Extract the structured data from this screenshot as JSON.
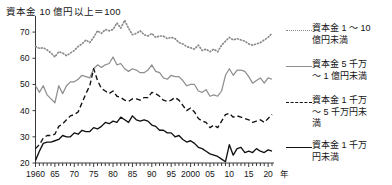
{
  "chart_data": {
    "type": "line",
    "title": "資本金 10 億円以上＝100",
    "xlabel": "年",
    "ylabel": "",
    "xlim": [
      1960,
      2021
    ],
    "ylim": [
      20,
      75
    ],
    "yticks": [
      20,
      30,
      40,
      50,
      60,
      70
    ],
    "xticks": [
      1960,
      1965,
      1970,
      1975,
      1980,
      1985,
      1990,
      1995,
      2000,
      2005,
      2010,
      2015,
      2020
    ],
    "xtick_labels": [
      "1960",
      "65",
      "70",
      "75",
      "80",
      "85",
      "90",
      "95",
      "2000",
      "05",
      "10",
      "15",
      "20"
    ],
    "grid": false,
    "legend_position": "right",
    "series": [
      {
        "name": "資本金 1 〜 10 億円未満",
        "style": "dotted",
        "color": "#8a8a8a",
        "x": [
          1960,
          1961,
          1962,
          1963,
          1964,
          1965,
          1966,
          1967,
          1968,
          1969,
          1970,
          1971,
          1972,
          1973,
          1974,
          1975,
          1976,
          1977,
          1978,
          1979,
          1980,
          1981,
          1982,
          1983,
          1984,
          1985,
          1986,
          1987,
          1988,
          1989,
          1990,
          1991,
          1992,
          1993,
          1994,
          1995,
          1996,
          1997,
          1998,
          1999,
          2000,
          2001,
          2002,
          2003,
          2004,
          2005,
          2006,
          2007,
          2008,
          2009,
          2010,
          2011,
          2012,
          2013,
          2014,
          2015,
          2016,
          2017,
          2018,
          2019,
          2020,
          2021
        ],
        "values": [
          64.5,
          63.8,
          64.0,
          63.2,
          62.0,
          60.5,
          62.5,
          62.0,
          61.0,
          62.0,
          63.0,
          64.5,
          65.5,
          67.0,
          66.0,
          68.0,
          70.5,
          69.5,
          71.0,
          70.5,
          71.0,
          73.5,
          71.5,
          74.5,
          71.5,
          69.0,
          69.5,
          70.5,
          69.0,
          68.5,
          69.5,
          68.0,
          68.5,
          68.5,
          67.5,
          68.0,
          67.5,
          66.0,
          65.5,
          64.5,
          64.0,
          63.5,
          65.0,
          63.0,
          63.5,
          62.5,
          63.5,
          62.5,
          65.0,
          66.5,
          68.0,
          67.0,
          67.5,
          67.0,
          66.5,
          65.5,
          65.0,
          65.5,
          66.0,
          67.0,
          68.0,
          69.5
        ]
      },
      {
        "name": "資本金 5 千万 〜 1 億円未満",
        "style": "solid",
        "color": "#8f8f8f",
        "x": [
          1960,
          1961,
          1962,
          1963,
          1964,
          1965,
          1966,
          1967,
          1968,
          1969,
          1970,
          1971,
          1972,
          1973,
          1974,
          1975,
          1976,
          1977,
          1978,
          1979,
          1980,
          1981,
          1982,
          1983,
          1984,
          1985,
          1986,
          1987,
          1988,
          1989,
          1990,
          1991,
          1992,
          1993,
          1994,
          1995,
          1996,
          1997,
          1998,
          1999,
          2000,
          2001,
          2002,
          2003,
          2004,
          2005,
          2006,
          2007,
          2008,
          2009,
          2010,
          2011,
          2012,
          2013,
          2014,
          2015,
          2016,
          2017,
          2018,
          2019,
          2020,
          2021
        ],
        "values": [
          49.5,
          47.0,
          49.5,
          46.0,
          44.5,
          43.0,
          49.5,
          46.5,
          49.5,
          51.0,
          51.0,
          52.0,
          53.5,
          53.0,
          52.5,
          56.0,
          57.5,
          56.5,
          57.5,
          58.0,
          60.5,
          57.5,
          58.0,
          56.0,
          55.0,
          56.0,
          55.5,
          54.5,
          54.5,
          55.5,
          57.5,
          55.0,
          54.5,
          52.5,
          52.0,
          53.5,
          53.0,
          53.0,
          51.5,
          49.5,
          50.0,
          50.0,
          47.5,
          47.0,
          48.0,
          45.5,
          46.0,
          45.5,
          47.5,
          53.5,
          56.0,
          53.5,
          55.5,
          55.5,
          55.0,
          53.0,
          50.5,
          51.5,
          52.5,
          50.5,
          52.5,
          52.0
        ]
      },
      {
        "name": "資本金 1 千万 〜 5 千万円未満",
        "style": "dashed",
        "color": "#111111",
        "x": [
          1960,
          1961,
          1962,
          1963,
          1964,
          1965,
          1966,
          1967,
          1968,
          1969,
          1970,
          1971,
          1972,
          1973,
          1974,
          1975,
          1976,
          1977,
          1978,
          1979,
          1980,
          1981,
          1982,
          1983,
          1984,
          1985,
          1986,
          1987,
          1988,
          1989,
          1990,
          1991,
          1992,
          1993,
          1994,
          1995,
          1996,
          1997,
          1998,
          1999,
          2000,
          2001,
          2002,
          2003,
          2004,
          2005,
          2006,
          2007,
          2008,
          2009,
          2010,
          2011,
          2012,
          2013,
          2014,
          2015,
          2016,
          2017,
          2018,
          2019,
          2020,
          2021
        ],
        "values": [
          25.5,
          27.0,
          29.5,
          30.5,
          30.5,
          31.0,
          34.0,
          35.0,
          36.5,
          38.0,
          38.5,
          39.5,
          43.0,
          46.5,
          49.5,
          56.0,
          51.5,
          48.5,
          47.5,
          46.5,
          47.5,
          45.5,
          45.0,
          44.0,
          43.5,
          44.5,
          44.5,
          44.0,
          45.0,
          45.0,
          47.0,
          46.5,
          45.5,
          44.0,
          43.5,
          44.0,
          45.0,
          44.0,
          42.0,
          40.0,
          41.0,
          39.5,
          37.0,
          36.0,
          35.5,
          33.5,
          34.5,
          33.5,
          36.0,
          38.5,
          39.0,
          37.5,
          38.0,
          37.5,
          37.0,
          36.5,
          35.5,
          36.0,
          36.5,
          35.5,
          37.0,
          38.5
        ]
      },
      {
        "name": "資本金 1 千万円未満",
        "style": "solid",
        "color": "#111111",
        "x": [
          1960,
          1961,
          1962,
          1963,
          1964,
          1965,
          1966,
          1967,
          1968,
          1969,
          1970,
          1971,
          1972,
          1973,
          1974,
          1975,
          1976,
          1977,
          1978,
          1979,
          1980,
          1981,
          1982,
          1983,
          1984,
          1985,
          1986,
          1987,
          1988,
          1989,
          1990,
          1991,
          1992,
          1993,
          1994,
          1995,
          1996,
          1997,
          1998,
          1999,
          2000,
          2001,
          2002,
          2003,
          2004,
          2005,
          2006,
          2007,
          2008,
          2009,
          2010,
          2011,
          2012,
          2013,
          2014,
          2015,
          2016,
          2017,
          2018,
          2019,
          2020,
          2021
        ],
        "values": [
          21.0,
          24.5,
          27.5,
          28.0,
          28.0,
          28.5,
          29.0,
          30.5,
          30.0,
          30.0,
          31.5,
          31.0,
          32.5,
          32.0,
          32.0,
          33.5,
          33.0,
          34.0,
          35.5,
          35.0,
          36.0,
          35.5,
          37.5,
          36.5,
          35.5,
          38.0,
          36.5,
          36.0,
          36.5,
          36.0,
          34.5,
          34.0,
          32.5,
          32.5,
          31.5,
          31.5,
          30.0,
          30.5,
          29.0,
          28.0,
          28.5,
          27.5,
          26.0,
          25.5,
          24.5,
          23.5,
          23.0,
          22.5,
          21.5,
          20.5,
          27.0,
          23.0,
          25.5,
          26.0,
          24.0,
          24.5,
          24.0,
          25.5,
          24.5,
          24.0,
          25.0,
          24.5
        ]
      }
    ]
  },
  "legend": {
    "items": [
      {
        "label_line1": "資本金 1 〜 10",
        "label_line2": "億円未満",
        "label_line3": "",
        "key": "dotted-line-key"
      },
      {
        "label_line1": "資本金 5 千万",
        "label_line2": "〜 1 億円未満",
        "label_line3": "",
        "key": "solid-gray-line-key"
      },
      {
        "label_line1": "資本金 1 千万",
        "label_line2": "〜 5 千万円未",
        "label_line3": "満",
        "key": "dashed-line-key"
      },
      {
        "label_line1": "資本金 1 千万",
        "label_line2": "円未満",
        "label_line3": "",
        "key": "solid-black-line-key"
      }
    ]
  },
  "axis": {
    "y_labels": [
      "70",
      "60",
      "50",
      "40",
      "30",
      "20"
    ],
    "x_labels": [
      "1960",
      "65",
      "70",
      "75",
      "80",
      "85",
      "90",
      "95",
      "2000",
      "05",
      "10",
      "15",
      "20"
    ],
    "x_unit": "年"
  }
}
